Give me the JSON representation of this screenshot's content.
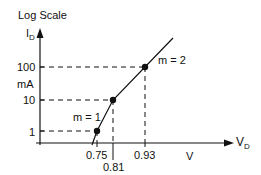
{
  "diagram": {
    "title": "Log Scale",
    "y_axis": {
      "label": "I",
      "label_subscript": "D",
      "unit": "mA",
      "ticks": [
        "100",
        "10",
        "1"
      ]
    },
    "x_axis": {
      "label": "V",
      "label_subscript": "D",
      "unit": "V",
      "ticks": [
        "0.75",
        "0.81",
        "0.93"
      ]
    },
    "points": [
      {
        "vd": "0.75",
        "id": "1"
      },
      {
        "vd": "0.81",
        "id": "10"
      },
      {
        "vd": "0.93",
        "id": "100"
      }
    ],
    "slope_labels": {
      "lower": "m = 1",
      "upper": "m = 2"
    },
    "colors": {
      "ink": "#111111",
      "background": "#ffffff"
    }
  }
}
